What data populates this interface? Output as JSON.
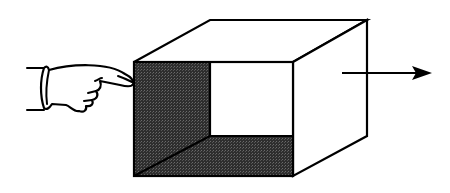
{
  "diagram": {
    "elements": [
      {
        "name": "pointing-hand",
        "role": "applies push"
      },
      {
        "name": "open-box",
        "role": "object being pushed"
      },
      {
        "name": "motion-arrow",
        "direction": "right"
      }
    ],
    "colors": {
      "line": "#000000",
      "shaded_interior": "#3a3a3a",
      "background": "#ffffff"
    }
  }
}
